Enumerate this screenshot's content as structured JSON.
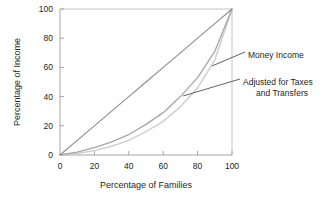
{
  "chart_data": {
    "type": "line",
    "title": "",
    "xlabel": "Percentage of Families",
    "ylabel": "Percentage of Income",
    "xlim": [
      0,
      100
    ],
    "ylim": [
      0,
      100
    ],
    "grid": false,
    "legend_position": "right-annotation",
    "xticks": [
      "0",
      "20",
      "40",
      "60",
      "80",
      "100"
    ],
    "yticks": [
      "0",
      "20",
      "40",
      "60",
      "80",
      "100"
    ],
    "x": [
      0,
      10,
      20,
      30,
      40,
      50,
      60,
      70,
      80,
      90,
      100
    ],
    "series": [
      {
        "name": "Line of Equality",
        "color": "#8c8c8c",
        "values": [
          0,
          10,
          20,
          30,
          40,
          50,
          60,
          70,
          80,
          90,
          100
        ]
      },
      {
        "name": "Adjusted for Taxes and Transfers",
        "color": "#a6a6a6",
        "values": [
          0,
          2,
          5,
          9,
          14,
          21,
          29,
          40,
          53,
          71,
          100
        ]
      },
      {
        "name": "Money Income",
        "color": "#cfcfcf",
        "values": [
          0,
          1,
          3,
          6,
          10,
          16,
          23,
          33,
          46,
          65,
          100
        ]
      }
    ],
    "annotations": [
      {
        "name": "money-income",
        "text": "Money Income",
        "label_x": 248,
        "label_y": 55,
        "leader_from_x": 245,
        "leader_from_y": 52,
        "leader_to_x": 212,
        "leader_to_y": 66
      },
      {
        "name": "adjusted-for-taxes",
        "text_line1": "Adjusted for Taxes",
        "text_line2": "and Transfers",
        "label_x": 243,
        "label_y": 82,
        "leader_from_x": 240,
        "leader_from_y": 79,
        "leader_to_x": 183,
        "leader_to_y": 96
      }
    ]
  },
  "axis": {
    "x_title": "Percentage of Families",
    "y_title": "Percentage of Income"
  },
  "colors": {
    "equality_line": "#8c8c8c",
    "adjusted_curve": "#a6a6a6",
    "money_curve": "#cfcfcf",
    "axis": "#9b9b9b",
    "text": "#231f20"
  }
}
